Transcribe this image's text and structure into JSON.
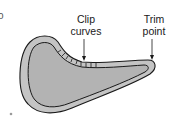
{
  "figure": {
    "corner_fragment": "o",
    "labels": {
      "clip": {
        "line1": "Clip",
        "line2": "curves"
      },
      "trim": {
        "line1": "Trim",
        "line2": "point"
      }
    },
    "colors": {
      "seam_allowance": "#c4c4c4",
      "fabric_fill": "#b3b3b3",
      "outline": "#1a1a1a"
    },
    "clip_mark_count": 9
  }
}
